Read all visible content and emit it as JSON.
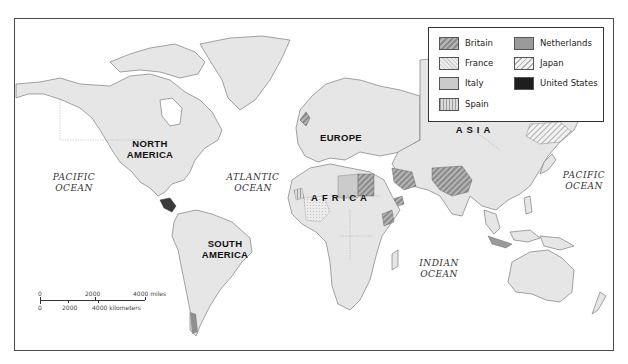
{
  "map": {
    "title": "",
    "regions": {
      "north_america": "NORTH\nAMERICA",
      "north_america_l1": "NORTH",
      "north_america_l2": "AMERICA",
      "south_america_l1": "SOUTH",
      "south_america_l2": "AMERICA",
      "europe": "EUROPE",
      "africa": "AFRICA",
      "asia": "ASIA"
    },
    "oceans": {
      "pacific_west_l1": "PACIFIC",
      "pacific_west_l2": "OCEAN",
      "atlantic_l1": "ATLANTIC",
      "atlantic_l2": "OCEAN",
      "indian_l1": "INDIAN",
      "indian_l2": "OCEAN",
      "pacific_east_l1": "PACIFIC",
      "pacific_east_l2": "OCEAN"
    }
  },
  "legend": {
    "items": [
      {
        "label": "Britain",
        "pattern": "diagonal-stripes-dark",
        "color": "#8d8d8d"
      },
      {
        "label": "France",
        "pattern": "light-crosshatch",
        "color": "#dddddd"
      },
      {
        "label": "Italy",
        "pattern": "solid-light-gray",
        "color": "#cbcbcb"
      },
      {
        "label": "Spain",
        "pattern": "vertical-stripes",
        "color": "#9f9f9f"
      },
      {
        "label": "Netherlands",
        "pattern": "solid-mid-gray",
        "color": "#9a9a9a"
      },
      {
        "label": "Japan",
        "pattern": "diagonal-stripes-light",
        "color": "#b0b0b0"
      },
      {
        "label": "United States",
        "pattern": "solid-black",
        "color": "#1e1e1e"
      }
    ]
  },
  "scale": {
    "miles_ticks": [
      "0",
      "2000",
      "4000 miles"
    ],
    "km_ticks": [
      "0",
      "2000",
      "4000 kilometers"
    ]
  },
  "colors": {
    "land": "#e6e6e6",
    "water": "#ffffff",
    "frame": "#4a4a4a"
  }
}
